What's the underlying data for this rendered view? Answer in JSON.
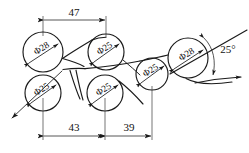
{
  "drawing": {
    "title": "Roller arrangement technical drawing",
    "units_note": "",
    "background_color": "#ffffff",
    "line_color": "#1a1a1a"
  },
  "circles": [
    {
      "id": "upper-left-roller",
      "label": "Φ28",
      "diameter": 28,
      "cx": 43,
      "cy": 52,
      "r": 20,
      "label_angle": -33
    },
    {
      "id": "upper-middle-roller",
      "label": "Φ25",
      "diameter": 25,
      "cx": 106,
      "cy": 52,
      "r": 18,
      "label_angle": -33
    },
    {
      "id": "lower-left-roller",
      "label": "Φ25",
      "diameter": 25,
      "cx": 43,
      "cy": 93,
      "r": 18,
      "label_angle": -33
    },
    {
      "id": "lower-middle-roller",
      "label": "Φ25",
      "diameter": 25,
      "cx": 105,
      "cy": 93,
      "r": 18,
      "label_angle": -33
    },
    {
      "id": "right-small-roller",
      "label": "Φ25",
      "diameter": 25,
      "cx": 152,
      "cy": 74,
      "r": 16,
      "label_angle": -33
    },
    {
      "id": "right-large-roller",
      "label": "Φ28",
      "diameter": 28,
      "cx": 188,
      "cy": 58,
      "r": 20,
      "label_angle": -33
    }
  ],
  "dimensions": [
    {
      "id": "top-dimension-47",
      "value": "47",
      "from_x": 43,
      "to_x": 106,
      "line_y": 20,
      "text_x": 74,
      "text_y": 13
    },
    {
      "id": "bottom-dimension-43",
      "value": "43",
      "from_x": 43,
      "to_x": 105,
      "line_y": 136,
      "text_x": 74,
      "text_y": 129
    },
    {
      "id": "bottom-dimension-39",
      "value": "39",
      "from_x": 105,
      "to_x": 152,
      "line_y": 136,
      "text_x": 129,
      "text_y": 129
    }
  ],
  "angle": {
    "id": "angle-25",
    "value": "25°",
    "text_x": 225,
    "text_y": 51,
    "vertex_x": 213,
    "vertex_y": 78
  }
}
